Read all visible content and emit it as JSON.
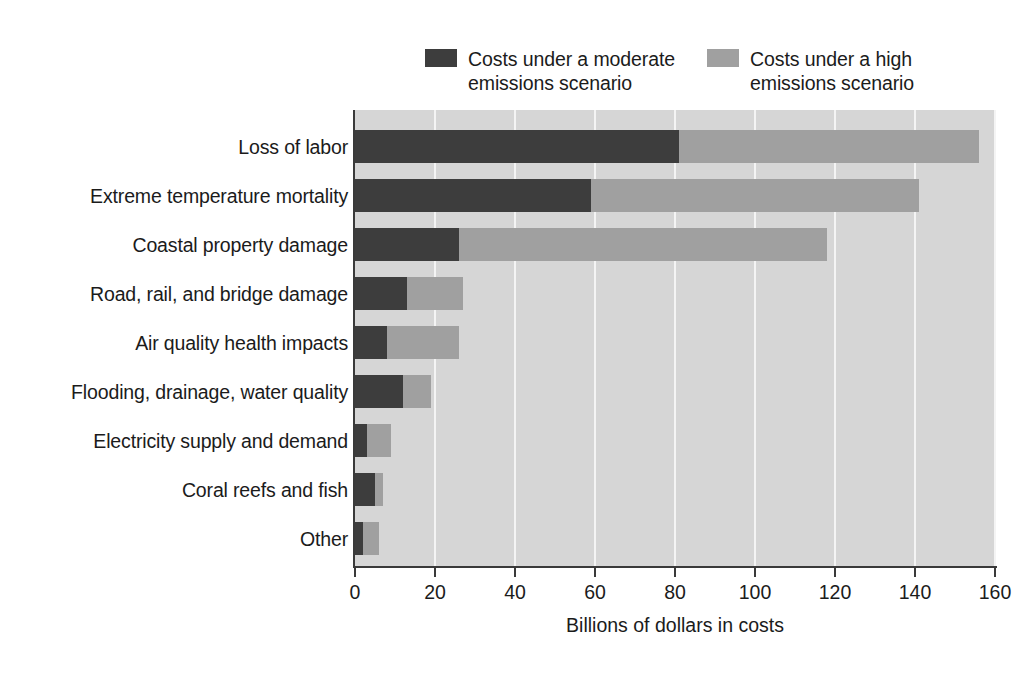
{
  "chart_data": {
    "type": "bar",
    "orientation": "horizontal",
    "stacked": true,
    "title": "",
    "xlabel": "Billions of dollars in costs",
    "ylabel": "",
    "xlim": [
      0,
      160
    ],
    "xticks": [
      0,
      20,
      40,
      60,
      80,
      100,
      120,
      140,
      160
    ],
    "grid": "vertical",
    "legend_position": "top",
    "categories": [
      "Loss of labor",
      "Extreme temperature mortality",
      "Coastal property damage",
      "Road, rail, and bridge damage",
      "Air quality health impacts",
      "Flooding, drainage, water quality",
      "Electricity supply and demand",
      "Coral reefs and fish",
      "Other"
    ],
    "series": [
      {
        "name": "Costs under a moderate emissions scenario",
        "color": "#3d3d3d",
        "values": [
          81,
          59,
          26,
          13,
          8,
          12,
          3,
          5,
          2
        ]
      },
      {
        "name": "Costs under a high emissions scenario",
        "color": "#a0a0a0",
        "values": [
          156,
          141,
          118,
          27,
          26,
          19,
          9,
          7,
          6
        ]
      }
    ]
  },
  "legend": {
    "items": [
      {
        "label": "Costs under a moderate\nemissions scenario",
        "color": "#3d3d3d"
      },
      {
        "label": "Costs under a high\nemissions scenario",
        "color": "#a0a0a0"
      }
    ]
  },
  "axis": {
    "x_title": "Billions of dollars in costs",
    "x_tick_labels": [
      "0",
      "20",
      "40",
      "60",
      "80",
      "100",
      "120",
      "140",
      "160"
    ]
  },
  "colors": {
    "plot_background": "#d6d6d6",
    "gridline": "#f4f4f4",
    "axis": "#3a3a3a",
    "page_background": "#ffffff",
    "text": "#1b1b1b"
  }
}
